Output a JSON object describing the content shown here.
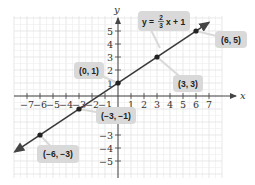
{
  "chart_data": {
    "type": "line",
    "title": "",
    "equation": {
      "lhs": "y =",
      "num": "2",
      "den": "3",
      "rhs": "x + 1"
    },
    "xlabel": "x",
    "ylabel": "y",
    "xlim": [
      -8,
      7.5
    ],
    "ylim": [
      -6,
      6
    ],
    "x_ticks": [
      -7,
      -6,
      -5,
      -4,
      -3,
      -2,
      -1,
      1,
      2,
      3,
      4,
      5,
      6,
      7
    ],
    "y_ticks": [
      -5,
      -4,
      -3,
      -1,
      1,
      2,
      3,
      4,
      5
    ],
    "grid": true,
    "slope": 0.6667,
    "intercept": 1,
    "points": [
      {
        "x": -6,
        "y": -3,
        "label": "(−6, −3)"
      },
      {
        "x": -3,
        "y": -1,
        "label": "(−3, −1)"
      },
      {
        "x": 0,
        "y": 1,
        "label": "(0, 1)"
      },
      {
        "x": 3,
        "y": 3,
        "label": "(3, 3)"
      },
      {
        "x": 6,
        "y": 5,
        "label": "(6, 5)"
      }
    ],
    "colors": {
      "line": "#3a3a3a",
      "grid": "#e6e6e6",
      "callout": "#d9d9d9",
      "axis": "#444444"
    }
  }
}
